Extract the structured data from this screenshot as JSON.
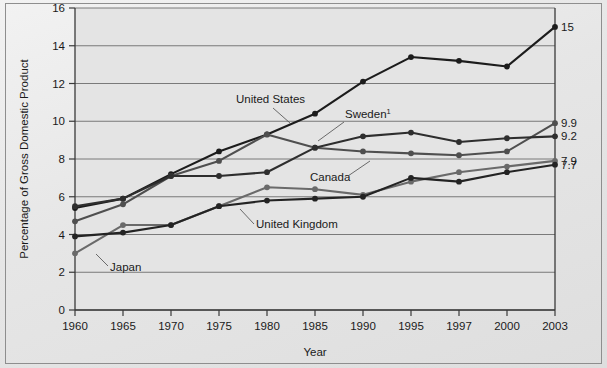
{
  "figure": {
    "background_color": "#e8e8e8",
    "plot_background_color": "#e4e4e4",
    "frame_color": "#3a3a3a"
  },
  "axes": {
    "y_axis_title": "Percentage of Gross Domestic Product",
    "x_axis_title": "Year",
    "y_ticks": [
      "0",
      "2",
      "4",
      "6",
      "8",
      "10",
      "12",
      "14",
      "16"
    ],
    "x_ticks": [
      "1960",
      "1965",
      "1970",
      "1975",
      "1980",
      "1985",
      "1990",
      "1995",
      "1997",
      "2000",
      "2003"
    ]
  },
  "annotations": {
    "united_states": "United States",
    "sweden": "Sweden",
    "sweden_superscript": "1",
    "canada": "Canada",
    "united_kingdom": "United Kingdom",
    "japan": "Japan"
  },
  "end_labels": {
    "united_states": "15",
    "sweden": "9.9",
    "canada": "9.2",
    "japan": "7.9",
    "united_kingdom": "7.7"
  },
  "chart_data": {
    "type": "line",
    "title": "",
    "xlabel": "Year",
    "ylabel": "Percentage of Gross Domestic Product",
    "ylim": [
      0,
      16
    ],
    "ytick_step": 2,
    "grid": true,
    "legend": "inline-annotations",
    "x": [
      "1960",
      "1965",
      "1970",
      "1975",
      "1980",
      "1985",
      "1990",
      "1995",
      "1997",
      "2000",
      "2003"
    ],
    "series": [
      {
        "name": "United States",
        "color": "#1c1c1c",
        "end_value_label": "15",
        "values": [
          5.4,
          5.9,
          7.2,
          8.4,
          9.3,
          10.4,
          12.1,
          13.4,
          13.2,
          12.9,
          15.0
        ]
      },
      {
        "name": "Sweden",
        "color": "#4f4f4f",
        "end_value_label": "9.9",
        "values": [
          4.7,
          5.6,
          7.1,
          7.9,
          9.3,
          8.6,
          8.4,
          8.3,
          8.2,
          8.4,
          9.9
        ]
      },
      {
        "name": "Canada",
        "color": "#2e2e2e",
        "end_value_label": "9.2",
        "values": [
          5.5,
          5.9,
          7.1,
          7.1,
          7.3,
          8.6,
          9.2,
          9.4,
          8.9,
          9.1,
          9.2
        ]
      },
      {
        "name": "Japan",
        "color": "#6a6a6a",
        "end_value_label": "7.9",
        "values": [
          3.0,
          4.5,
          4.5,
          5.5,
          6.5,
          6.4,
          6.1,
          6.8,
          7.3,
          7.6,
          7.9
        ]
      },
      {
        "name": "United Kingdom",
        "color": "#232323",
        "end_value_label": "7.7",
        "values": [
          3.9,
          4.1,
          4.5,
          5.5,
          5.8,
          5.9,
          6.0,
          7.0,
          6.8,
          7.3,
          7.7
        ]
      }
    ]
  }
}
